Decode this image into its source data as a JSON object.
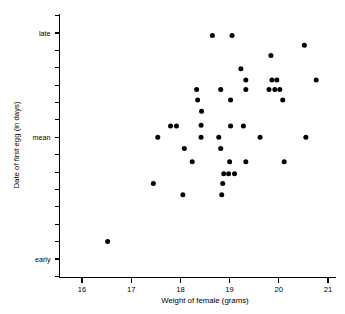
{
  "chart_data": {
    "type": "scatter",
    "title": "",
    "xlabel": "Weight of female (grams)",
    "ylabel": "Date of first egg (in days)",
    "xlim": [
      15.55,
      21.12
    ],
    "ylim": [
      0,
      17
    ],
    "grid": false,
    "legend": null,
    "xticks": [
      16,
      17,
      18,
      19,
      20,
      21
    ],
    "xticklabels": [
      "16",
      "17",
      "18",
      "19",
      "20",
      "21"
    ],
    "yticks": [
      1,
      2,
      3,
      4,
      5,
      6,
      7,
      8,
      9,
      10,
      11,
      12,
      13,
      14,
      15,
      16
    ],
    "ylabeled_ticks": [
      {
        "value": 15,
        "label": "late"
      },
      {
        "value": 9,
        "label": "mean"
      },
      {
        "value": 2,
        "label": "early"
      }
    ],
    "marker": "filled-circle",
    "marker_color": "#000000",
    "marker_size_px": 4.6,
    "n_points": 48,
    "points": [
      {
        "x": 18.65,
        "y": 14.85
      },
      {
        "x": 19.05,
        "y": 14.85
      },
      {
        "x": 20.52,
        "y": 14.3
      },
      {
        "x": 19.84,
        "y": 13.7
      },
      {
        "x": 19.23,
        "y": 12.95
      },
      {
        "x": 19.33,
        "y": 12.3
      },
      {
        "x": 19.86,
        "y": 12.3
      },
      {
        "x": 19.96,
        "y": 12.3
      },
      {
        "x": 20.76,
        "y": 12.3
      },
      {
        "x": 18.33,
        "y": 11.75
      },
      {
        "x": 18.82,
        "y": 11.75
      },
      {
        "x": 19.33,
        "y": 11.75
      },
      {
        "x": 19.8,
        "y": 11.75
      },
      {
        "x": 19.92,
        "y": 11.75
      },
      {
        "x": 20.02,
        "y": 11.75
      },
      {
        "x": 18.35,
        "y": 11.15
      },
      {
        "x": 19.02,
        "y": 11.15
      },
      {
        "x": 20.08,
        "y": 11.15
      },
      {
        "x": 18.43,
        "y": 10.5
      },
      {
        "x": 18.42,
        "y": 9.7
      },
      {
        "x": 17.8,
        "y": 9.65
      },
      {
        "x": 17.92,
        "y": 9.65
      },
      {
        "x": 19.02,
        "y": 9.65
      },
      {
        "x": 19.28,
        "y": 9.65
      },
      {
        "x": 17.54,
        "y": 9.0
      },
      {
        "x": 18.42,
        "y": 9.0
      },
      {
        "x": 18.78,
        "y": 9.0
      },
      {
        "x": 19.62,
        "y": 9.0
      },
      {
        "x": 20.55,
        "y": 9.0
      },
      {
        "x": 18.08,
        "y": 8.35
      },
      {
        "x": 18.82,
        "y": 8.35
      },
      {
        "x": 18.24,
        "y": 7.6
      },
      {
        "x": 19.0,
        "y": 7.6
      },
      {
        "x": 19.33,
        "y": 7.6
      },
      {
        "x": 20.11,
        "y": 7.6
      },
      {
        "x": 18.88,
        "y": 6.9
      },
      {
        "x": 18.98,
        "y": 6.9
      },
      {
        "x": 19.1,
        "y": 6.9
      },
      {
        "x": 17.45,
        "y": 6.35
      },
      {
        "x": 18.86,
        "y": 6.35
      },
      {
        "x": 18.05,
        "y": 5.7
      },
      {
        "x": 18.84,
        "y": 5.7
      },
      {
        "x": 16.52,
        "y": 3.0
      }
    ]
  },
  "figure": {
    "axis_color": "#000000",
    "background": "#ffffff"
  }
}
